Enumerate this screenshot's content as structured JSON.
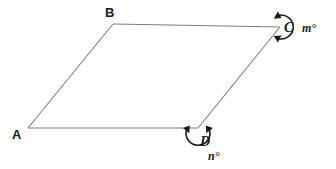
{
  "figure": {
    "type": "geometry-diagram",
    "shape": "parallelogram",
    "background_color": "#ffffff",
    "edge_color": "#7d7d7d",
    "marker_color": "#1a1a1a",
    "vertices": [
      {
        "id": "A",
        "label": "A",
        "x": 28,
        "y": 128,
        "label_x": 12,
        "label_y": 139
      },
      {
        "id": "B",
        "label": "B",
        "x": 113,
        "y": 24,
        "label_x": 105,
        "label_y": 17
      },
      {
        "id": "C",
        "label": "C",
        "x": 280,
        "y": 27,
        "label_x": 284,
        "label_y": 32
      },
      {
        "id": "D",
        "label": "D",
        "x": 198,
        "y": 128,
        "label_x": 200,
        "label_y": 146
      }
    ],
    "edges": [
      {
        "from": "A",
        "to": "B"
      },
      {
        "from": "B",
        "to": "C"
      },
      {
        "from": "C",
        "to": "D"
      },
      {
        "from": "D",
        "to": "A"
      }
    ],
    "angle_markers": [
      {
        "vertex": "C",
        "label": "m°",
        "label_x": 302,
        "label_y": 32,
        "kind": "reflex-arc",
        "arrowheads": 2
      },
      {
        "vertex": "D",
        "label": "n°",
        "label_x": 208,
        "label_y": 160,
        "kind": "reflex-arc",
        "arrowheads": 2
      }
    ]
  }
}
